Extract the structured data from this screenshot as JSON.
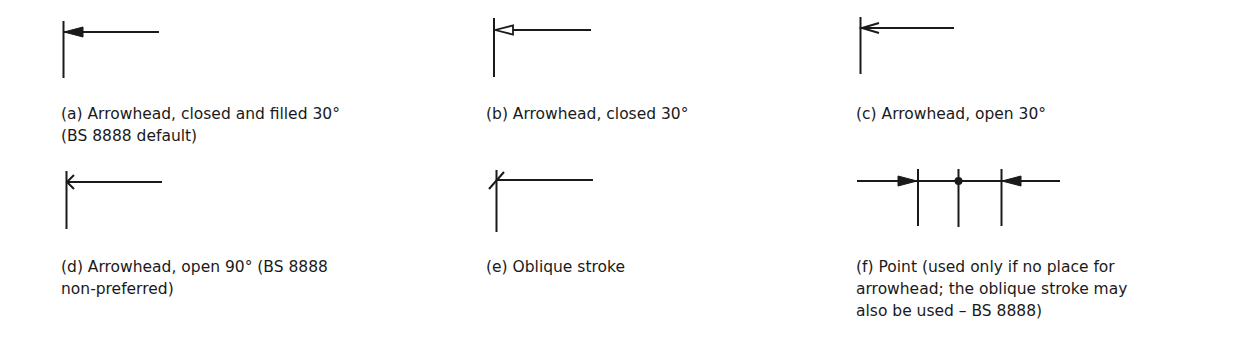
{
  "panels": [
    {
      "id": "a",
      "label": "(a)",
      "title": "Arrowhead, closed and filled 30°",
      "caption_lines": [
        "(a)  Arrowhead, closed and filled 30°",
        "(BS 8888 default)"
      ],
      "terminator": "closed-filled-30"
    },
    {
      "id": "b",
      "label": "(b)",
      "title": "Arrowhead, closed 30°",
      "caption_lines": [
        "(b)  Arrowhead, closed 30°"
      ],
      "terminator": "closed-30"
    },
    {
      "id": "c",
      "label": "(c)",
      "title": "Arrowhead, open 30°",
      "caption_lines": [
        "(c)  Arrowhead, open 30°"
      ],
      "terminator": "open-30"
    },
    {
      "id": "d",
      "label": "(d)",
      "title": "Arrowhead, open 90° (BS 8888 non-preferred)",
      "caption_lines": [
        "(d)  Arrowhead, open 90° (BS 8888",
        "non-preferred)"
      ],
      "terminator": "open-90"
    },
    {
      "id": "e",
      "label": "(e)",
      "title": "Oblique stroke",
      "caption_lines": [
        "(e)  Oblique stroke"
      ],
      "terminator": "oblique-stroke"
    },
    {
      "id": "f",
      "label": "(f)",
      "title": "Point (used only if no place for arrowhead; the oblique stroke may also be used – BS 8888)",
      "caption_lines": [
        "(f)  Point (used only if no place for",
        "arrowhead; the oblique stroke may",
        "also be used – BS 8888)"
      ],
      "terminator": "point"
    }
  ],
  "colors": {
    "line": "#1a1a1a",
    "background": "#ffffff"
  }
}
